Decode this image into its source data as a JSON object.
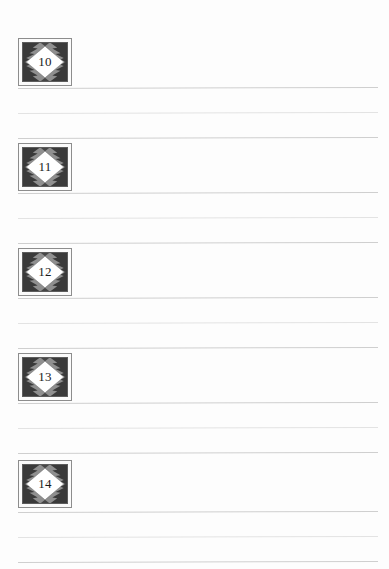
{
  "page": {
    "background_color": "#fdfdfd",
    "width": 389,
    "height": 569,
    "type": "ruled-worksheet-page"
  },
  "theme": {
    "rule_color": "#d8d8d8",
    "rule_color_faint": "#e3e3e3",
    "tile_outer_border": "#8d8d8d",
    "tile_inner_border": "#5d5d5d",
    "tile_background": "#8f8f8f",
    "tile_pattern_dark": "#3a3a3a",
    "diamond_fill": "#ffffff",
    "number_color": "#1b1b1b"
  },
  "entries": [
    {
      "number": "10",
      "icon_name": "diamond-ornament-icon",
      "tile_top": 38,
      "rules": [
        {
          "y": 88,
          "shade": "dark"
        },
        {
          "y": 113,
          "shade": "faint"
        },
        {
          "y": 138,
          "shade": "dark"
        }
      ]
    },
    {
      "number": "11",
      "icon_name": "diamond-ornament-icon",
      "tile_top": 143,
      "rules": [
        {
          "y": 193,
          "shade": "dark"
        },
        {
          "y": 218,
          "shade": "faint"
        },
        {
          "y": 243,
          "shade": "dark"
        }
      ]
    },
    {
      "number": "12",
      "icon_name": "diamond-ornament-icon",
      "tile_top": 248,
      "rules": [
        {
          "y": 298,
          "shade": "dark"
        },
        {
          "y": 323,
          "shade": "faint"
        },
        {
          "y": 348,
          "shade": "dark"
        }
      ]
    },
    {
      "number": "13",
      "icon_name": "diamond-ornament-icon",
      "tile_top": 353,
      "rules": [
        {
          "y": 403,
          "shade": "dark"
        },
        {
          "y": 428,
          "shade": "faint"
        },
        {
          "y": 453,
          "shade": "dark"
        }
      ]
    },
    {
      "number": "14",
      "icon_name": "diamond-ornament-icon",
      "tile_top": 460,
      "rules": [
        {
          "y": 512,
          "shade": "dark"
        },
        {
          "y": 537,
          "shade": "faint"
        },
        {
          "y": 562,
          "shade": "dark"
        }
      ]
    }
  ]
}
